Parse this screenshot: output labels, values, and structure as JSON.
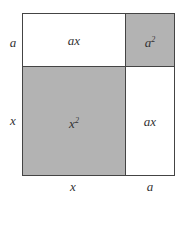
{
  "diagram": {
    "title": "",
    "colors": {
      "shaded": "#b3b3b3",
      "unshaded": "#ffffff",
      "border": "#444444"
    },
    "side_labels": {
      "left_top": "a",
      "left_bottom": "x",
      "bottom_left": "x",
      "bottom_right": "a"
    },
    "regions": [
      {
        "id": "top-left",
        "label": "ax",
        "shaded": false
      },
      {
        "id": "top-right",
        "label_base": "a",
        "label_exp": "2",
        "shaded": true
      },
      {
        "id": "bottom-left",
        "label_base": "x",
        "label_exp": "2",
        "shaded": true
      },
      {
        "id": "bottom-right",
        "label": "ax",
        "shaded": false
      }
    ]
  }
}
